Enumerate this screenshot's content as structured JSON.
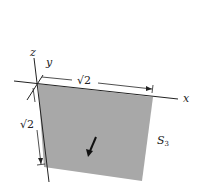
{
  "diagram": {
    "surface_label": "S",
    "surface_subscript": "3",
    "axes": {
      "x": "x",
      "y": "y",
      "z": "z"
    },
    "dimensions": {
      "top_width": "√2",
      "side_height": "√2"
    },
    "colors": {
      "surface_fill": "#a8a8a8",
      "stroke": "#222222",
      "background": "#ffffff"
    },
    "normal_vector": "arrow pointing into/down the surface"
  }
}
